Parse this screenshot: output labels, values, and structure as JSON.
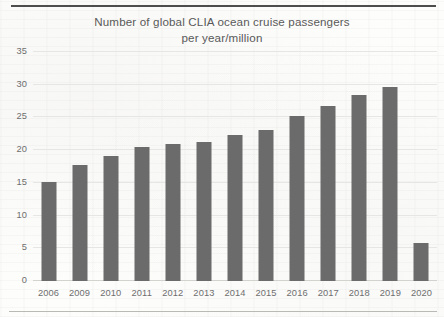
{
  "chart_data": {
    "type": "bar",
    "title": "Number of global CLIA ocean cruise passengers\nper year/million",
    "xlabel": "",
    "ylabel": "",
    "ylim": [
      0,
      35
    ],
    "yticks": [
      "0",
      "5",
      "10",
      "15",
      "20",
      "25",
      "30",
      "35"
    ],
    "ytick_values": [
      0,
      5,
      10,
      15,
      20,
      25,
      30,
      35
    ],
    "grid": true,
    "legend": "none",
    "bar_color": "#6b6b6b",
    "categories": [
      "2006",
      "2009",
      "2010",
      "2011",
      "2012",
      "2013",
      "2014",
      "2015",
      "2016",
      "2017",
      "2018",
      "2019",
      "2020"
    ],
    "values": [
      15.1,
      17.8,
      19.1,
      20.5,
      20.9,
      21.3,
      22.3,
      23.1,
      25.2,
      26.7,
      28.5,
      29.7,
      5.8
    ]
  },
  "page": {
    "top_rule": "horizontal-rule",
    "bottom_rule": "horizontal-rule"
  }
}
